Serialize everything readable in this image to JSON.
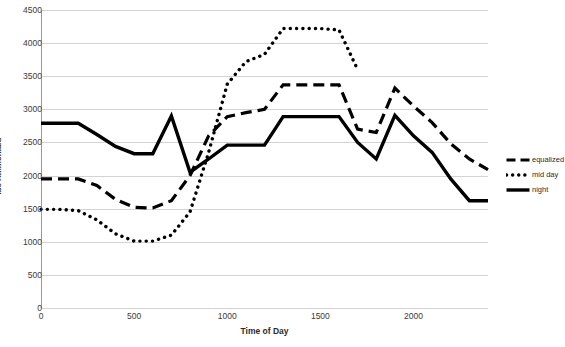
{
  "chart_data": {
    "type": "line",
    "title": "",
    "xlabel": "Time of Day",
    "ylabel": "lbs Ammonia/d",
    "xlim": [
      0,
      2400
    ],
    "ylim": [
      0,
      4500
    ],
    "xticks": [
      0,
      500,
      1000,
      1500,
      2000
    ],
    "yticks": [
      0,
      500,
      1000,
      1500,
      2000,
      2500,
      3000,
      3500,
      4000,
      4500
    ],
    "grid": true,
    "legend_position": "right",
    "series": [
      {
        "name": "equalized",
        "style": "dashed",
        "x": [
          0,
          100,
          200,
          300,
          400,
          500,
          600,
          700,
          800,
          900,
          1000,
          1100,
          1200,
          1300,
          1400,
          1500,
          1600,
          1700,
          1800,
          1900,
          2000,
          2100,
          2200,
          2300,
          2400
        ],
        "values": [
          1950,
          1950,
          1950,
          1850,
          1640,
          1520,
          1510,
          1620,
          2000,
          2600,
          2890,
          2950,
          3000,
          3370,
          3370,
          3370,
          3370,
          2700,
          2650,
          3320,
          3050,
          2800,
          2480,
          2250,
          2090
        ]
      },
      {
        "name": "mid day",
        "style": "dotted",
        "x": [
          0,
          100,
          200,
          300,
          400,
          500,
          600,
          700,
          800,
          900,
          1000,
          1100,
          1200,
          1300,
          1400,
          1500,
          1600,
          1700
        ],
        "values": [
          1490,
          1490,
          1470,
          1330,
          1120,
          1010,
          1010,
          1100,
          1450,
          2350,
          3380,
          3720,
          3830,
          4220,
          4220,
          4220,
          4200,
          3600
        ]
      },
      {
        "name": "night",
        "style": "solid",
        "x": [
          0,
          100,
          200,
          300,
          400,
          500,
          600,
          700,
          800,
          900,
          1000,
          1100,
          1200,
          1300,
          1400,
          1500,
          1600,
          1700,
          1800,
          1900,
          2000,
          2100,
          2200,
          2300,
          2400
        ],
        "values": [
          2790,
          2790,
          2790,
          2620,
          2440,
          2330,
          2330,
          2900,
          2050,
          2250,
          2460,
          2460,
          2460,
          2890,
          2890,
          2890,
          2890,
          2500,
          2250,
          2910,
          2600,
          2350,
          1950,
          1620,
          1620
        ]
      }
    ]
  },
  "legend": {
    "items": [
      {
        "label": "equalized",
        "style": "dashed"
      },
      {
        "label": "mid day",
        "style": "dotted"
      },
      {
        "label": "night",
        "style": "solid"
      }
    ]
  },
  "colors": {
    "series": "#000000",
    "grid": "#d3d3d3",
    "axis": "#9a9a9a",
    "text": "#2b2b2b",
    "background": "#ffffff"
  }
}
